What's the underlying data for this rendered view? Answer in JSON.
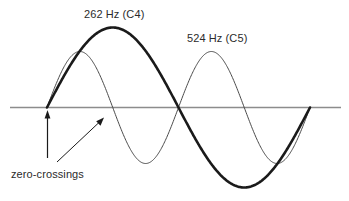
{
  "figure": {
    "title": "",
    "background_color": "#ffffff",
    "axis_color": "#8c8c8c",
    "labels": {
      "fundamental": "262 Hz (C4)",
      "harmonic": "524 Hz (C5)",
      "annotation": "zero-crossings"
    },
    "annotations": [
      {
        "name": "vertical-arrow",
        "target": "first zero-crossing"
      },
      {
        "name": "diagonal-arrow",
        "target": "second zero-crossing"
      }
    ]
  },
  "chart_data": {
    "type": "line",
    "title": "",
    "xlabel": "",
    "ylabel": "",
    "grid": false,
    "legend": "inline-annotations",
    "axis": {
      "baseline_y": 0,
      "x_start": 47,
      "x_end": 310,
      "ylim": [
        -1,
        1
      ]
    },
    "series": [
      {
        "name": "262 Hz (C4)",
        "frequency_hz": 262,
        "note": "C4",
        "cycles": 1,
        "amplitude": 1.0,
        "color": "#1a1a1a",
        "stroke_width": 2.6,
        "phase": 0,
        "peaks": [
          {
            "x_px": 115,
            "y_px": 27
          }
        ],
        "troughs": [
          {
            "x_px": 245,
            "y_px": 188
          }
        ],
        "zero_crossings_px": [
          47,
          181,
          308
        ]
      },
      {
        "name": "524 Hz (C5)",
        "frequency_hz": 524,
        "note": "C5",
        "cycles": 2,
        "amplitude": 0.7,
        "color": "#4a4a4a",
        "stroke_width": 1.0,
        "phase": 0,
        "peaks": [
          {
            "x_px": 80,
            "y_px": 51
          },
          {
            "x_px": 211,
            "y_px": 51
          }
        ],
        "troughs": [
          {
            "x_px": 146,
            "y_px": 165
          },
          {
            "x_px": 277,
            "y_px": 165
          }
        ],
        "zero_crossings_px": [
          47,
          113,
          179,
          245,
          311
        ]
      }
    ],
    "annotations": [
      {
        "text": "262 Hz (C4)",
        "x_px": 84,
        "y_px": 8
      },
      {
        "text": "524 Hz (C5)",
        "x_px": 187,
        "y_px": 32
      },
      {
        "text": "zero-crossings",
        "x_px": 11,
        "y_px": 168
      }
    ]
  }
}
